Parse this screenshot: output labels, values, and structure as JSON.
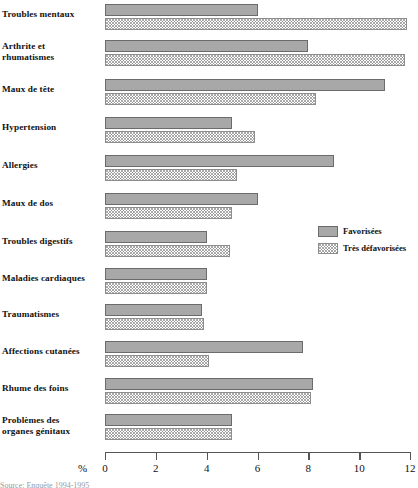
{
  "chart_data": {
    "type": "bar",
    "orientation": "horizontal",
    "title": "",
    "subtitle": "",
    "xlabel": "%",
    "ylabel": "",
    "xlim": [
      0,
      12
    ],
    "xticks": [
      0,
      2,
      4,
      6,
      8,
      10,
      12
    ],
    "xtick_labels": [
      "0",
      "2",
      "4",
      "6",
      "8",
      "10",
      "12"
    ],
    "grid": false,
    "legend_position": "center-right",
    "categories": [
      "Troubles mentaux",
      "Arthrite et rhumatismes",
      "Maux de tête",
      "Hypertension",
      "Allergies",
      "Maux de dos",
      "Troubles digestifs",
      "Maladies cardiaques",
      "Traumatismes",
      "Affections cutanées",
      "Rhume des foins",
      "Problèmes des organes génitaux"
    ],
    "series": [
      {
        "name": "Favorisées",
        "color": "#a8a8a8",
        "pattern": "solid",
        "values": [
          6.0,
          8.0,
          11.0,
          5.0,
          9.0,
          6.0,
          4.0,
          4.0,
          3.8,
          7.8,
          8.2,
          5.0
        ]
      },
      {
        "name": "Très défavorisées",
        "color": "#ffffff",
        "pattern": "dotted",
        "values": [
          11.9,
          11.8,
          8.3,
          5.9,
          5.2,
          5.0,
          4.9,
          4.0,
          3.9,
          4.1,
          8.1,
          5.0
        ]
      }
    ]
  },
  "axis": {
    "unit_label": "%"
  },
  "legend": {
    "items": [
      {
        "label": "Favorisées",
        "swatch": "solid-gray-swatch"
      },
      {
        "label": "Très défavorisées",
        "swatch": "dotted-swatch"
      }
    ]
  },
  "category_labels": [
    [
      "Troubles mentaux"
    ],
    [
      "Arthrite et",
      "rhumatismes"
    ],
    [
      "Maux de tête"
    ],
    [
      "Hypertension"
    ],
    [
      "Allergies"
    ],
    [
      "Maux de dos"
    ],
    [
      "Troubles digestifs"
    ],
    [
      "Maladies cardiaques"
    ],
    [
      "Traumatismes"
    ],
    [
      "Affections cutanées"
    ],
    [
      "Rhume des foins"
    ],
    [
      "Problèmes des",
      "organes génitaux"
    ]
  ],
  "caption": {
    "cut_off_text": "Source: Enquête 1994-1995"
  }
}
